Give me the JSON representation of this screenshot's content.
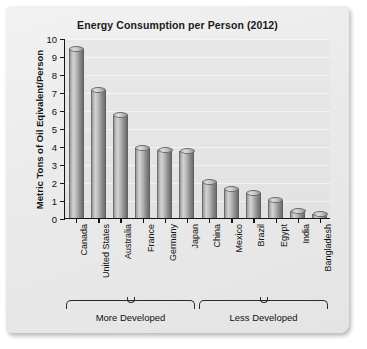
{
  "chart_data": {
    "type": "bar",
    "title": "Energy Consumption per Person (2012)",
    "xlabel": "",
    "ylabel": "Metric Tons of Oil Eqivalent/Person",
    "ylim": [
      0,
      10
    ],
    "ytick_labels": [
      "10",
      "9",
      "8",
      "7",
      "6",
      "5",
      "4",
      "3",
      "2",
      "1",
      "0"
    ],
    "ytick_values": [
      10,
      9,
      8,
      7,
      6,
      5,
      4,
      3,
      2,
      1,
      0
    ],
    "grid": true,
    "legend": "none",
    "categories": [
      "Canada",
      "United States",
      "Australia",
      "France",
      "Germany",
      "Japan",
      "China",
      "Mexico",
      "Brazil",
      "Egypt",
      "India",
      "Bangladesh"
    ],
    "values": [
      9.4,
      7.1,
      5.7,
      3.9,
      3.8,
      3.7,
      2.0,
      1.6,
      1.4,
      1.0,
      0.4,
      0.2
    ],
    "groups": [
      {
        "label": "More Developed",
        "start_index": 0,
        "end_index": 5
      },
      {
        "label": "Less Developed",
        "start_index": 6,
        "end_index": 11
      }
    ],
    "colors": {
      "bar": "#a8a8a8",
      "bar_shadow": "#6e6e6e",
      "bar_highlight": "#d3d3d3",
      "plot_background": "#e5e5e5",
      "card_background": "#ebebeb",
      "axis": "#141414",
      "text": "#111111"
    }
  }
}
